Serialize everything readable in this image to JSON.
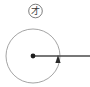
{
  "figure": {
    "name": "circle-with-radial-arrow-diagram",
    "background_color": "#ffffff",
    "width": 90,
    "height": 87,
    "badge": {
      "glyph": "才",
      "icon_name": "circled-character-badge",
      "center_x": 35.5,
      "center_y": 11,
      "radius": 6.8,
      "stroke_color": "#6e6e6e",
      "stroke_width": 0.9,
      "text_color": "#3a3a3a",
      "font_size": 9
    },
    "main_circle": {
      "name": "main-circle",
      "center_x": 33,
      "center_y": 56,
      "radius": 27,
      "stroke_color": "#9a9a9a",
      "stroke_width": 0.9,
      "fill": "none"
    },
    "center_dot": {
      "name": "center-point-dot",
      "cx": 33,
      "cy": 56,
      "r": 2.4,
      "color": "#1c1c1c"
    },
    "radial_line": {
      "name": "radial-ray-line",
      "x1": 33,
      "y1": 56,
      "x2": 90,
      "y2": 56,
      "stroke_color": "#4a4a4a",
      "stroke_width": 1.6
    },
    "arrow_marker": {
      "name": "up-arrowhead-marker",
      "tip_x": 58,
      "tip_y": 55,
      "half_width": 2.6,
      "height": 8,
      "color": "#2a2a2a",
      "direction": "up"
    }
  }
}
